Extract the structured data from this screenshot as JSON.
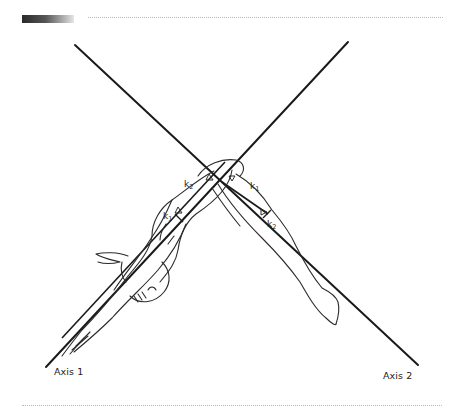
{
  "figure": {
    "axes": [
      {
        "id": "axis-1",
        "label": "Axis 1"
      },
      {
        "id": "axis-2",
        "label": "Axis 2"
      }
    ],
    "segment_labels": {
      "upper_left_k2": {
        "base": "k",
        "sub": "2"
      },
      "upper_left_k1": {
        "base": "k",
        "sub": "1"
      },
      "right_k1": {
        "base": "k",
        "sub": "1"
      },
      "right_k2": {
        "base": "k",
        "sub": "2"
      }
    }
  },
  "colors": {
    "line": "#1a1a1a",
    "outline": "#2b2b2b",
    "rule": "#b9b9b9"
  }
}
